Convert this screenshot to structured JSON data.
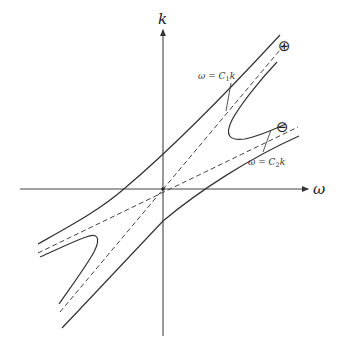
{
  "diagram": {
    "title": "",
    "axes": {
      "x_label": "ω",
      "y_label": "k"
    },
    "branch_labels": {
      "plus": "⊕",
      "minus": "⊖"
    },
    "asymptote_labels": {
      "c1": "ω = C₁k",
      "c1_parts": {
        "lhs": "ω",
        "eq": " = ",
        "c": "C",
        "sub": "1",
        "var": "k"
      },
      "c2": "ω = C₂k",
      "c2_parts": {
        "lhs": "ω",
        "eq": " = ",
        "c": "C",
        "sub": "2",
        "var": "k"
      }
    },
    "colors": {
      "stroke": "#333333",
      "background": "#ffffff"
    }
  }
}
